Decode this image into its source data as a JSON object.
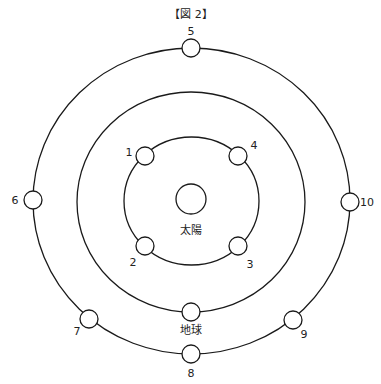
{
  "title": "【図 2】",
  "colors": {
    "stroke": "#1a1a1a",
    "fill": "#ffffff",
    "text": "#222222"
  },
  "orbits": [
    {
      "name": "inner-orbit",
      "cx": 191.5,
      "cy": 201,
      "rx": 67.5,
      "ry": 64
    },
    {
      "name": "earth-orbit",
      "cx": 191,
      "cy": 202,
      "rx": 114,
      "ry": 110
    },
    {
      "name": "outer-orbit",
      "cx": 191.5,
      "cy": 201,
      "rx": 158.5,
      "ry": 153
    }
  ],
  "sun": {
    "label": "太陽",
    "cx": 191,
    "cy": 199,
    "r": 15,
    "label_x": 191,
    "label_y": 234
  },
  "earth": {
    "label": "地球",
    "cx": 191,
    "cy": 312,
    "r": 9,
    "label_x": 191,
    "label_y": 334
  },
  "positions": [
    {
      "id": "1",
      "label": "1",
      "cx": 145,
      "cy": 156,
      "label_x": 129,
      "label_y": 156
    },
    {
      "id": "2",
      "label": "2",
      "cx": 145,
      "cy": 246,
      "label_x": 133,
      "label_y": 266
    },
    {
      "id": "3",
      "label": "3",
      "cx": 238,
      "cy": 246,
      "label_x": 250,
      "label_y": 268
    },
    {
      "id": "4",
      "label": "4",
      "cx": 238,
      "cy": 156,
      "label_x": 254,
      "label_y": 149
    },
    {
      "id": "5",
      "label": "5",
      "cx": 191,
      "cy": 48,
      "label_x": 191,
      "label_y": 35
    },
    {
      "id": "6",
      "label": "6",
      "cx": 33,
      "cy": 200,
      "label_x": 15,
      "label_y": 204
    },
    {
      "id": "7",
      "label": "7",
      "cx": 89,
      "cy": 319,
      "label_x": 77,
      "label_y": 335
    },
    {
      "id": "8",
      "label": "8",
      "cx": 191,
      "cy": 354,
      "label_x": 191,
      "label_y": 377
    },
    {
      "id": "9",
      "label": "9",
      "cx": 293,
      "cy": 320,
      "label_x": 304,
      "label_y": 338
    },
    {
      "id": "10",
      "label": "10",
      "cx": 350,
      "cy": 202,
      "label_x": 367,
      "label_y": 206
    }
  ],
  "planet_radius": 9
}
